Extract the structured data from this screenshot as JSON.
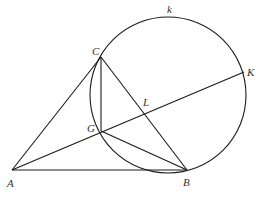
{
  "figure": {
    "type": "geometry-diagram",
    "stroke_color": "#1a1a1a",
    "label_color": "#333333",
    "circle": {
      "name": "k",
      "label": "k",
      "center": [
        168,
        95
      ],
      "radius": 78
    },
    "points": {
      "A": {
        "label": "A",
        "x": 12,
        "y": 170
      },
      "B": {
        "label": "B",
        "x": 187,
        "y": 170
      },
      "C": {
        "label": "C",
        "x": 101,
        "y": 57
      },
      "G": {
        "label": "G",
        "x": 101,
        "y": 131
      },
      "L": {
        "label": "L",
        "x": 146,
        "y": 111
      },
      "K": {
        "label": "K",
        "x": 244,
        "y": 72
      }
    },
    "segments": [
      [
        "A",
        "B"
      ],
      [
        "A",
        "C"
      ],
      [
        "C",
        "B"
      ],
      [
        "C",
        "G"
      ],
      [
        "G",
        "B"
      ],
      [
        "A",
        "K"
      ]
    ]
  },
  "labels": {
    "A": "A",
    "B": "B",
    "C": "C",
    "G": "G",
    "L": "L",
    "K": "K",
    "k": "k"
  }
}
